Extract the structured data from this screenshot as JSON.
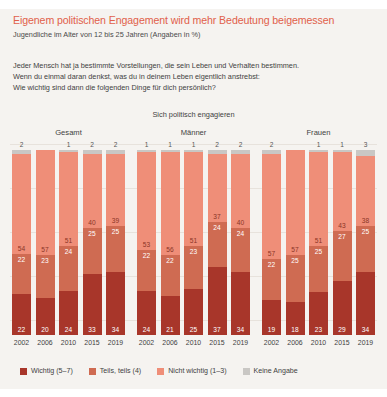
{
  "headline": "Eigenem politischen Engagement wird mehr Bedeutung beigemessen",
  "subhead": "Jugendliche im Alter von 12 bis 25 Jahren (Angaben in %)",
  "intro_lines": [
    "Jeder Mensch hat ja bestimmte Vorstellungen, die sein Leben und Verhalten bestimmen.",
    "Wenn du einmal daran denkst, was du in deinem Leben eigentlich anstrebst:",
    "Wie wichtig sind dann die folgenden Dinge für dich persönlich?"
  ],
  "question_title": "Sich politisch engagieren",
  "colors": {
    "headline": "#e1604a",
    "wichtig": "#a8362a",
    "teils": "#cf6b52",
    "nicht_wichtig": "#ef8e78",
    "keine_angabe": "#c9c7c4",
    "background": "#f5f3f0"
  },
  "legend": [
    {
      "label": "Wichtig (5–7)",
      "color": "#a8362a",
      "key": "wichtig"
    },
    {
      "label": "Teils, teils (4)",
      "color": "#cf6b52",
      "key": "teils"
    },
    {
      "label": "Nicht wichtig (1–3)",
      "color": "#ef8e78",
      "key": "nicht_wichtig"
    },
    {
      "label": "Keine Angabe",
      "color": "#c9c7c4",
      "key": "keine_angabe"
    }
  ],
  "chart_data": {
    "type": "bar",
    "title": "Eigenem politischen Engagement wird mehr Bedeutung beigemessen",
    "subtitle": "Jugendliche im Alter von 12 bis 25 Jahren (Angaben in %)",
    "annotation": "Sich politisch engagieren",
    "stacked": true,
    "stack_order_bottom_to_top": [
      "wichtig",
      "teils",
      "nicht_wichtig",
      "keine_angabe"
    ],
    "ylim": [
      0,
      100
    ],
    "ylabel": "",
    "xlabel": "",
    "grid": true,
    "legend_position": "bottom",
    "categories": [
      "2002",
      "2006",
      "2010",
      "2015",
      "2019"
    ],
    "groups": [
      {
        "name": "Gesamt",
        "bars": [
          {
            "year": "2002",
            "wichtig": 22,
            "teils": 22,
            "nicht_wichtig": 54,
            "keine_angabe": 2
          },
          {
            "year": "2006",
            "wichtig": 20,
            "teils": 23,
            "nicht_wichtig": 57,
            "keine_angabe": ""
          },
          {
            "year": "2010",
            "wichtig": 24,
            "teils": 24,
            "nicht_wichtig": 51,
            "keine_angabe": 1
          },
          {
            "year": "2015",
            "wichtig": 33,
            "teils": 25,
            "nicht_wichtig": 40,
            "keine_angabe": 2
          },
          {
            "year": "2019",
            "wichtig": 34,
            "teils": 25,
            "nicht_wichtig": 39,
            "keine_angabe": 2
          }
        ]
      },
      {
        "name": "Männer",
        "bars": [
          {
            "year": "2002",
            "wichtig": 24,
            "teils": 22,
            "nicht_wichtig": 53,
            "keine_angabe": 1
          },
          {
            "year": "2006",
            "wichtig": 21,
            "teils": 22,
            "nicht_wichtig": 56,
            "keine_angabe": 1
          },
          {
            "year": "2010",
            "wichtig": 25,
            "teils": 23,
            "nicht_wichtig": 51,
            "keine_angabe": 1
          },
          {
            "year": "2015",
            "wichtig": 37,
            "teils": 24,
            "nicht_wichtig": 37,
            "keine_angabe": 2
          },
          {
            "year": "2019",
            "wichtig": 34,
            "teils": 24,
            "nicht_wichtig": 40,
            "keine_angabe": 2
          }
        ]
      },
      {
        "name": "Frauen",
        "bars": [
          {
            "year": "2002",
            "wichtig": 19,
            "teils": 22,
            "nicht_wichtig": 57,
            "keine_angabe": 2
          },
          {
            "year": "2006",
            "wichtig": 18,
            "teils": 25,
            "nicht_wichtig": 57,
            "keine_angabe": ""
          },
          {
            "year": "2010",
            "wichtig": 23,
            "teils": 25,
            "nicht_wichtig": 51,
            "keine_angabe": 1
          },
          {
            "year": "2015",
            "wichtig": 29,
            "teils": 27,
            "nicht_wichtig": 43,
            "keine_angabe": 1
          },
          {
            "year": "2019",
            "wichtig": 34,
            "teils": 25,
            "nicht_wichtig": 38,
            "keine_angabe": 3
          }
        ]
      }
    ]
  }
}
